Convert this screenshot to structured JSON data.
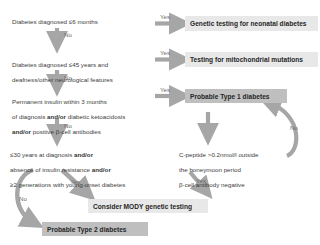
{
  "diagram": {
    "colors": {
      "arrow": "#a6a6a6",
      "box_dark": "#bfbfbf",
      "box_light": "#e8e8e8",
      "text": "#3c3c3c",
      "label_text": "#6b6b6b",
      "background": "#ffffff"
    },
    "questions": [
      {
        "id": "q1",
        "lines": [
          "Diabetes diagnosed ≤6 months"
        ]
      },
      {
        "id": "q2",
        "lines": [
          "Diabetes diagnosed ≤45 years and",
          "deafness/other neurological features"
        ]
      },
      {
        "id": "q3",
        "lines": [
          "Permanent insulin within 3 months",
          "of diagnosis and/or diabetic ketoacidosis",
          "and/or positive β-cell antibodies"
        ]
      },
      {
        "id": "q4",
        "lines": [
          "≤30 years at diagnosis and/or",
          "absence of insulin resistance and/or",
          "≥2 generations with young-onset diabetes"
        ]
      },
      {
        "id": "q5",
        "lines": [
          "C-peptide >0.2nmol/l outside",
          "the honeymoon period",
          "β-cell antibody negative"
        ]
      }
    ],
    "results": [
      {
        "id": "r1",
        "label": "Genetic testing for neonatal diabetes",
        "style": "light"
      },
      {
        "id": "r2",
        "label": "Testing for mitochondrial mutations",
        "style": "light"
      },
      {
        "id": "r3",
        "label": "Probable Type 1 diabetes",
        "style": "dark"
      },
      {
        "id": "r4",
        "label": "Consider MODY genetic testing",
        "style": "light"
      },
      {
        "id": "r5",
        "label": "Probable Type 2 diabetes",
        "style": "dark"
      }
    ],
    "edge_labels": [
      {
        "id": "e1",
        "label": "Yes"
      },
      {
        "id": "e2",
        "label": "No"
      },
      {
        "id": "e3",
        "label": "Yes"
      },
      {
        "id": "e4",
        "label": "No"
      },
      {
        "id": "e5",
        "label": "Yes"
      },
      {
        "id": "e6",
        "label": "No"
      },
      {
        "id": "e7",
        "label": "No"
      },
      {
        "id": "e8",
        "label": "Yes"
      },
      {
        "id": "e9",
        "label": "No"
      },
      {
        "id": "e10",
        "label": "Yes"
      }
    ]
  }
}
